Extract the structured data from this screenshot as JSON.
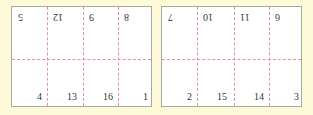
{
  "colors": {
    "background": "#fdfad7",
    "sheet": "#ffffff",
    "border": "#a9a9a0",
    "fold_line": "#e8909f",
    "text": "#333333"
  },
  "sheets": [
    {
      "name": "sheet-left",
      "top_row_rotated_180": [
        "5",
        "12",
        "9",
        "8"
      ],
      "bottom_row": [
        "4",
        "13",
        "16",
        "1"
      ]
    },
    {
      "name": "sheet-right",
      "top_row_rotated_180": [
        "7",
        "10",
        "11",
        "6"
      ],
      "bottom_row": [
        "2",
        "15",
        "14",
        "3"
      ]
    }
  ]
}
